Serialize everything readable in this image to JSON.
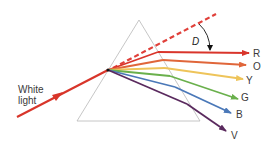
{
  "diagram": {
    "incoming_label_line1": "White",
    "incoming_label_line2": "light",
    "deviation_label": "D",
    "colors": {
      "incident": "#d8352a",
      "dashed": "#e0403a",
      "prism": "#b8b8b8",
      "label": "#3a3a3a"
    },
    "rays": [
      {
        "label": "R",
        "color": "#d9352b"
      },
      {
        "label": "O",
        "color": "#e0663a"
      },
      {
        "label": "Y",
        "color": "#eec45a"
      },
      {
        "label": "G",
        "color": "#6ab04c"
      },
      {
        "label": "B",
        "color": "#4a78b8"
      },
      {
        "label": "V",
        "color": "#5a2a5e"
      }
    ]
  }
}
